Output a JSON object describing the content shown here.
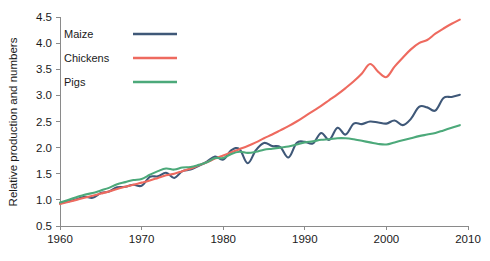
{
  "chart_data": {
    "type": "line",
    "title": "",
    "xlabel": "",
    "ylabel": "Relative production and numbers",
    "xlim": [
      1960,
      2010
    ],
    "ylim": [
      0.5,
      4.5
    ],
    "xticks": [
      1960,
      1970,
      1980,
      1990,
      2000,
      2010
    ],
    "xtick_labels": [
      "1960",
      "1970",
      "1980",
      "1990",
      "2000",
      "2010"
    ],
    "yticks": [
      0.5,
      1.0,
      1.5,
      2.0,
      2.5,
      3.0,
      3.5,
      4.0,
      4.5
    ],
    "ytick_labels": [
      "0.5",
      "1.0",
      "1.5",
      "2.0",
      "2.5",
      "3.0",
      "3.5",
      "4.0",
      "4.5"
    ],
    "grid": false,
    "legend_position": "top-left",
    "series": [
      {
        "name": "Maize",
        "color": "#3f5878",
        "x": [
          1960,
          1961,
          1962,
          1963,
          1964,
          1965,
          1966,
          1967,
          1968,
          1969,
          1970,
          1971,
          1972,
          1973,
          1974,
          1975,
          1976,
          1977,
          1978,
          1979,
          1980,
          1981,
          1982,
          1983,
          1984,
          1985,
          1986,
          1987,
          1988,
          1989,
          1990,
          1991,
          1992,
          1993,
          1994,
          1995,
          1996,
          1997,
          1998,
          1999,
          2000,
          2001,
          2002,
          2003,
          2004,
          2005,
          2006,
          2007,
          2008,
          2009
        ],
        "values": [
          0.93,
          0.97,
          1.01,
          1.06,
          1.04,
          1.13,
          1.16,
          1.24,
          1.25,
          1.29,
          1.27,
          1.44,
          1.45,
          1.52,
          1.42,
          1.55,
          1.58,
          1.65,
          1.73,
          1.83,
          1.77,
          1.95,
          1.97,
          1.7,
          1.95,
          2.09,
          2.03,
          2.01,
          1.81,
          2.09,
          2.11,
          2.08,
          2.28,
          2.15,
          2.38,
          2.25,
          2.46,
          2.45,
          2.5,
          2.48,
          2.46,
          2.52,
          2.43,
          2.55,
          2.78,
          2.77,
          2.71,
          2.95,
          2.97,
          3.01
        ]
      },
      {
        "name": "Chickens",
        "color": "#ee6a5f",
        "x": [
          1960,
          1961,
          1962,
          1963,
          1964,
          1965,
          1966,
          1967,
          1968,
          1969,
          1970,
          1971,
          1972,
          1973,
          1974,
          1975,
          1976,
          1977,
          1978,
          1979,
          1980,
          1981,
          1982,
          1983,
          1984,
          1985,
          1986,
          1987,
          1988,
          1989,
          1990,
          1991,
          1992,
          1993,
          1994,
          1995,
          1996,
          1997,
          1998,
          1999,
          2000,
          2001,
          2002,
          2003,
          2004,
          2005,
          2006,
          2007,
          2008,
          2009
        ],
        "values": [
          0.92,
          0.96,
          1.0,
          1.04,
          1.08,
          1.12,
          1.16,
          1.21,
          1.25,
          1.29,
          1.33,
          1.37,
          1.42,
          1.47,
          1.5,
          1.55,
          1.6,
          1.66,
          1.72,
          1.79,
          1.85,
          1.91,
          1.97,
          2.03,
          2.1,
          2.18,
          2.25,
          2.33,
          2.41,
          2.5,
          2.6,
          2.7,
          2.8,
          2.91,
          3.02,
          3.14,
          3.27,
          3.42,
          3.6,
          3.45,
          3.35,
          3.55,
          3.72,
          3.88,
          4.0,
          4.06,
          4.18,
          4.28,
          4.37,
          4.45
        ]
      },
      {
        "name": "Pigs",
        "color": "#4ca97a",
        "x": [
          1960,
          1961,
          1962,
          1963,
          1964,
          1965,
          1966,
          1967,
          1968,
          1969,
          1970,
          1971,
          1972,
          1973,
          1974,
          1975,
          1976,
          1977,
          1978,
          1979,
          1980,
          1981,
          1982,
          1983,
          1984,
          1985,
          1986,
          1987,
          1988,
          1989,
          1990,
          1991,
          1992,
          1993,
          1994,
          1995,
          1996,
          1997,
          1998,
          1999,
          2000,
          2001,
          2002,
          2003,
          2004,
          2005,
          2006,
          2007,
          2008,
          2009
        ],
        "values": [
          0.95,
          1.0,
          1.05,
          1.1,
          1.13,
          1.18,
          1.23,
          1.3,
          1.34,
          1.38,
          1.4,
          1.48,
          1.55,
          1.6,
          1.58,
          1.62,
          1.63,
          1.67,
          1.72,
          1.8,
          1.8,
          1.88,
          1.92,
          1.9,
          1.92,
          1.96,
          1.98,
          2.0,
          2.02,
          2.06,
          2.1,
          2.12,
          2.15,
          2.16,
          2.18,
          2.18,
          2.16,
          2.13,
          2.1,
          2.07,
          2.06,
          2.1,
          2.14,
          2.18,
          2.22,
          2.25,
          2.28,
          2.33,
          2.38,
          2.43
        ]
      }
    ]
  },
  "legend": {
    "items": [
      {
        "label": "Maize",
        "color": "#3f5878"
      },
      {
        "label": "Chickens",
        "color": "#ee6a5f"
      },
      {
        "label": "Pigs",
        "color": "#4ca97a"
      }
    ]
  }
}
